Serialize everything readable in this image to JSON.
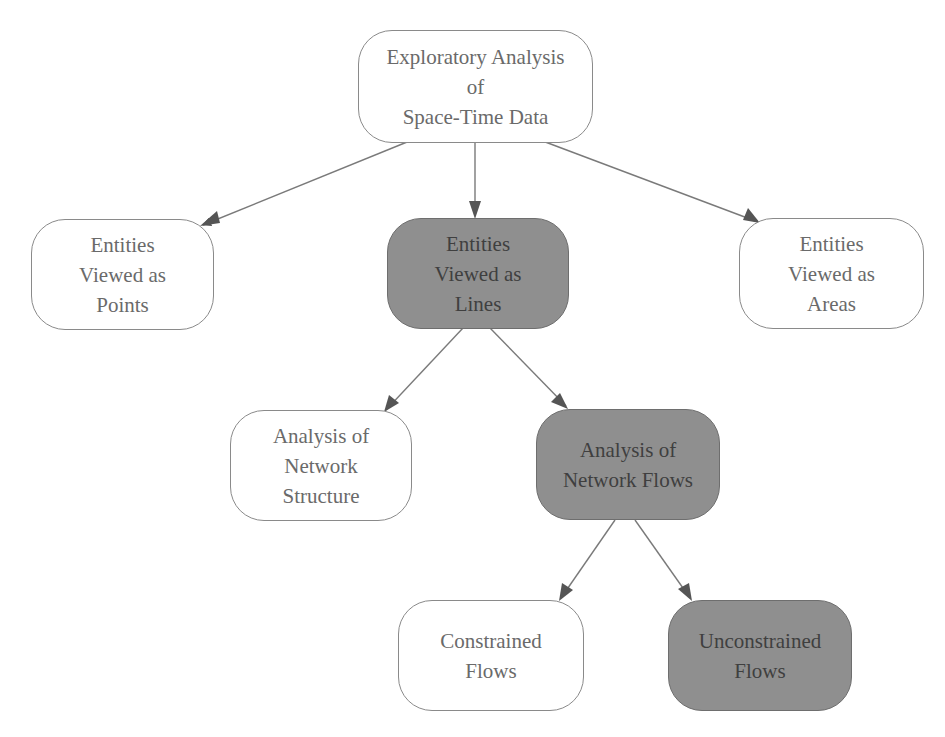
{
  "diagram": {
    "type": "tree",
    "nodes": [
      {
        "id": "root",
        "label": "Exploratory Analysis\nof\nSpace-Time Data",
        "highlighted": false
      },
      {
        "id": "points",
        "label": "Entities\nViewed as\nPoints",
        "highlighted": false
      },
      {
        "id": "lines",
        "label": "Entities\nViewed as\nLines",
        "highlighted": true
      },
      {
        "id": "areas",
        "label": "Entities\nViewed as\nAreas",
        "highlighted": false
      },
      {
        "id": "structure",
        "label": "Analysis of\nNetwork\nStructure",
        "highlighted": false
      },
      {
        "id": "flows",
        "label": "Analysis of\nNetwork Flows",
        "highlighted": true
      },
      {
        "id": "constrained",
        "label": "Constrained\nFlows",
        "highlighted": false
      },
      {
        "id": "unconstrained",
        "label": "Unconstrained\nFlows",
        "highlighted": true
      }
    ],
    "edges": [
      {
        "from": "root",
        "to": "points"
      },
      {
        "from": "root",
        "to": "lines"
      },
      {
        "from": "root",
        "to": "areas"
      },
      {
        "from": "lines",
        "to": "structure"
      },
      {
        "from": "lines",
        "to": "flows"
      },
      {
        "from": "flows",
        "to": "constrained"
      },
      {
        "from": "flows",
        "to": "unconstrained"
      }
    ],
    "colors": {
      "highlight_fill": "#8f8f8f",
      "normal_fill": "#ffffff",
      "border": "#8a8a8a",
      "edge": "#7a7a7a",
      "arrowhead": "#555555"
    }
  }
}
